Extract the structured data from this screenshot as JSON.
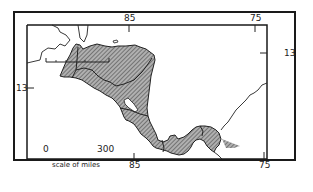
{
  "map": {
    "subject": "Central America",
    "colors": {
      "land_fill": "#9a9a9a",
      "hatch": "#555555",
      "outline": "#222222",
      "background": "#ffffff"
    },
    "longitude_labels": {
      "top": [
        "85",
        "75"
      ],
      "bottom": [
        "85",
        "75"
      ]
    },
    "latitude_labels": {
      "left": [
        "13"
      ],
      "right": [
        "13"
      ]
    },
    "scale_bar": {
      "start": "0",
      "end": "300",
      "caption": "scale of miles"
    }
  }
}
